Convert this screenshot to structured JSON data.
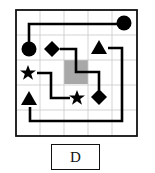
{
  "figure": {
    "option_label": "D",
    "grid": {
      "rows": 5,
      "cols": 5,
      "minor_subdivisions": 1
    },
    "colors": {
      "border": "#111111",
      "grid_line": "#c8c8c8",
      "shape_fill": "#000000",
      "path_line": "#000000",
      "shaded_cell": "#a8a8a8"
    },
    "shaded_cells": [
      {
        "row": 2,
        "col": 2
      }
    ],
    "shapes": [
      {
        "type": "circle",
        "row": 0,
        "col": 4
      },
      {
        "type": "circle",
        "row": 1,
        "col": 0
      },
      {
        "type": "diamond",
        "row": 1,
        "col": 1
      },
      {
        "type": "triangle",
        "row": 1,
        "col": 3
      },
      {
        "type": "star",
        "row": 2,
        "col": 0
      },
      {
        "type": "triangle",
        "row": 3,
        "col": 0
      },
      {
        "type": "star",
        "row": 3,
        "col": 2
      },
      {
        "type": "diamond",
        "row": 3,
        "col": 3
      }
    ],
    "paths": [
      {
        "connects": [
          "circle",
          "circle"
        ]
      },
      {
        "connects": [
          "diamond",
          "diamond"
        ]
      },
      {
        "connects": [
          "star",
          "star"
        ]
      },
      {
        "connects": [
          "triangle",
          "triangle"
        ]
      }
    ]
  }
}
